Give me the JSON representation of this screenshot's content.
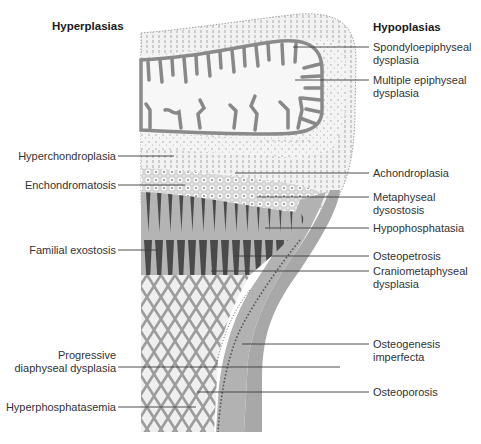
{
  "figure": {
    "left_heading": "Hyperplasias",
    "right_heading": "Hypoplasias",
    "colors": {
      "line": "#3a3a3a",
      "bone_cortex": "#a8a8a8",
      "trabeculae": "#8c8c8c",
      "cartilage": "#eeeeee",
      "dark_columns": "#4a4a4a"
    }
  },
  "left_labels": [
    {
      "id": "hyperchondroplasia",
      "text": "Hyperchondroplasia"
    },
    {
      "id": "enchondromatosis",
      "text": "Enchondromatosis"
    },
    {
      "id": "familial-exostosis",
      "text": "Familial exostosis"
    },
    {
      "id": "progressive-diaphyseal-dysplasia",
      "line1": "Progressive",
      "line2": "diaphyseal dysplasia"
    },
    {
      "id": "hyperphosphatasemia",
      "text": "Hyperphosphatasemia"
    }
  ],
  "right_labels": [
    {
      "id": "spondyloepiphyseal-dysplasia",
      "line1": "Spondyloepiphyseal",
      "line2": "dysplasia"
    },
    {
      "id": "multiple-epiphyseal-dysplasia",
      "line1": "Multiple epiphyseal",
      "line2": "dysplasia"
    },
    {
      "id": "achondroplasia",
      "text": "Achondroplasia"
    },
    {
      "id": "metaphyseal-dysostosis",
      "line1": "Metaphyseal",
      "line2": "dysostosis"
    },
    {
      "id": "hypophosphatasia",
      "text": "Hypophosphatasia"
    },
    {
      "id": "osteopetrosis",
      "text": "Osteopetrosis"
    },
    {
      "id": "craniometaphyseal-dysplasia",
      "line1": "Craniometaphyseal",
      "line2": "dysplasia"
    },
    {
      "id": "osteogenesis-imperfecta",
      "line1": "Osteogenesis",
      "line2": "imperfecta"
    },
    {
      "id": "osteoporosis",
      "text": "Osteoporosis"
    }
  ]
}
